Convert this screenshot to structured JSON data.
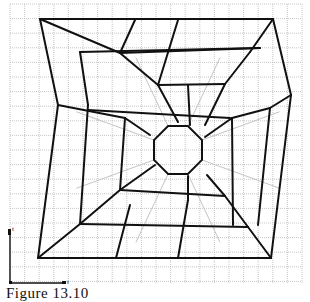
{
  "figure": {
    "caption": "Figure 13.10",
    "axes": {
      "x_label": "t",
      "y_label": "t"
    },
    "grid": {
      "x0": 10,
      "y0": 4,
      "x1": 302,
      "y1": 284,
      "step": 14.6,
      "color": "#b8b8b8"
    },
    "colors": {
      "mesh": "#111111",
      "faint_mesh": "#c4c4c4",
      "background": "#ffffff"
    },
    "mesh_lines": [
      [
        [
          40,
          19
        ],
        [
          273,
          19
        ]
      ],
      [
        [
          273,
          19
        ],
        [
          291,
          95
        ]
      ],
      [
        [
          291,
          95
        ],
        [
          271,
          258
        ]
      ],
      [
        [
          271,
          258
        ],
        [
          38,
          258
        ]
      ],
      [
        [
          38,
          258
        ],
        [
          58,
          105
        ]
      ],
      [
        [
          58,
          105
        ],
        [
          40,
          19
        ]
      ],
      [
        [
          40,
          19
        ],
        [
          120,
          53
        ]
      ],
      [
        [
          120,
          53
        ],
        [
          158,
          85
        ]
      ],
      [
        [
          158,
          85
        ],
        [
          178,
          122
        ]
      ],
      [
        [
          273,
          19
        ],
        [
          250,
          52
        ]
      ],
      [
        [
          250,
          52
        ],
        [
          225,
          84
        ]
      ],
      [
        [
          225,
          84
        ],
        [
          205,
          125
        ]
      ],
      [
        [
          291,
          95
        ],
        [
          270,
          108
        ]
      ],
      [
        [
          270,
          108
        ],
        [
          232,
          118
        ]
      ],
      [
        [
          232,
          118
        ],
        [
          205,
          137
        ]
      ],
      [
        [
          271,
          258
        ],
        [
          248,
          227
        ]
      ],
      [
        [
          248,
          227
        ],
        [
          225,
          196
        ]
      ],
      [
        [
          225,
          196
        ],
        [
          207,
          175
        ]
      ],
      [
        [
          38,
          258
        ],
        [
          80,
          224
        ]
      ],
      [
        [
          80,
          224
        ],
        [
          120,
          190
        ]
      ],
      [
        [
          120,
          190
        ],
        [
          155,
          165
        ]
      ],
      [
        [
          58,
          105
        ],
        [
          125,
          118
        ]
      ],
      [
        [
          125,
          118
        ],
        [
          150,
          135
        ]
      ],
      [
        [
          120,
          53
        ],
        [
          135,
          20
        ]
      ],
      [
        [
          158,
          85
        ],
        [
          178,
          20
        ]
      ],
      [
        [
          80,
          224
        ],
        [
          88,
          105
        ]
      ],
      [
        [
          88,
          105
        ],
        [
          80,
          52
        ]
      ],
      [
        [
          125,
          118
        ],
        [
          120,
          190
        ]
      ],
      [
        [
          120,
          53
        ],
        [
          260,
          48
        ]
      ],
      [
        [
          80,
          52
        ],
        [
          260,
          48
        ]
      ],
      [
        [
          88,
          110
        ],
        [
          230,
          118
        ]
      ],
      [
        [
          80,
          224
        ],
        [
          248,
          227
        ]
      ],
      [
        [
          120,
          190
        ],
        [
          225,
          196
        ]
      ],
      [
        [
          158,
          85
        ],
        [
          225,
          84
        ]
      ],
      [
        [
          178,
          258
        ],
        [
          188,
          200
        ]
      ],
      [
        [
          188,
          200
        ],
        [
          188,
          176
        ]
      ],
      [
        [
          116,
          258
        ],
        [
          130,
          205
        ]
      ],
      [
        [
          232,
          118
        ],
        [
          233,
          225
        ]
      ],
      [
        [
          270,
          108
        ],
        [
          258,
          225
        ]
      ],
      [
        [
          188,
          85
        ],
        [
          190,
          125
        ]
      ]
    ],
    "octagon": {
      "cx": 178,
      "cy": 150,
      "r": 26
    }
  }
}
